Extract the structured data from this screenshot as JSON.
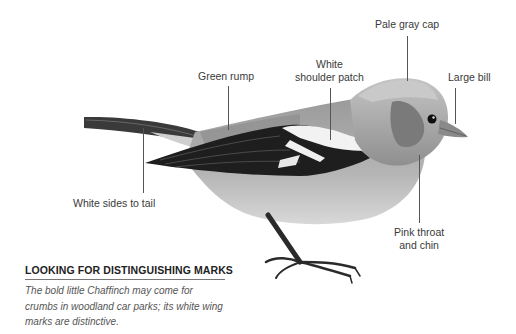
{
  "labels": {
    "pale_gray_cap": "Pale gray cap",
    "green_rump": "Green rump",
    "white_shoulder_patch_line1": "White",
    "white_shoulder_patch_line2": "shoulder patch",
    "large_bill": "Large bill",
    "white_sides_to_tail": "White sides to tail",
    "pink_throat_line1": "Pink throat",
    "pink_throat_line2": "and chin"
  },
  "caption": {
    "heading": "LOOKING FOR DISTINGUISHING MARKS",
    "body": "The bold little Chaffinch may come for crumbs in woodland car parks; its white wing marks are distinctive."
  },
  "illustration": {
    "subject": "chaffinch-bird",
    "palette": {
      "body": "#a9a9a9",
      "wing": "#1e1e1e",
      "patch": "#f2f2f2",
      "cap": "#b8b8b8",
      "cheek": "#7a7a7a",
      "leader": "#555555"
    }
  }
}
